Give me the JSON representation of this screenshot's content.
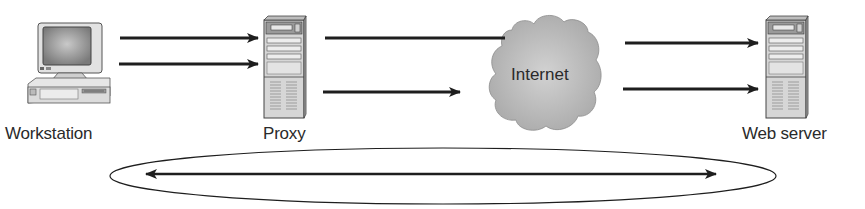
{
  "diagram": {
    "nodes": [
      {
        "id": "workstation",
        "label": "Workstation",
        "icon": "desktop-computer-icon"
      },
      {
        "id": "proxy",
        "label": "Proxy",
        "icon": "server-tower-icon"
      },
      {
        "id": "internet",
        "label": "Internet",
        "icon": "cloud-icon"
      },
      {
        "id": "web_server",
        "label": "Web server",
        "icon": "server-tower-icon"
      }
    ],
    "edges": [
      {
        "from": "workstation",
        "to": "proxy",
        "style": "arrow"
      },
      {
        "from": "workstation",
        "to": "proxy",
        "style": "arrow"
      },
      {
        "from": "proxy",
        "to": "internet",
        "style": "line"
      },
      {
        "from": "proxy",
        "to": "internet",
        "style": "arrow"
      },
      {
        "from": "internet",
        "to": "web_server",
        "style": "arrow"
      },
      {
        "from": "internet",
        "to": "web_server",
        "style": "arrow"
      },
      {
        "from": "workstation",
        "to": "web_server",
        "style": "double-arrow-in-ellipse"
      }
    ],
    "colors": {
      "line": "#1e1e1e",
      "device_fill": "#d8d8d8",
      "cloud_fill": "#bdbdbd",
      "text": "#2a2a2a"
    }
  }
}
